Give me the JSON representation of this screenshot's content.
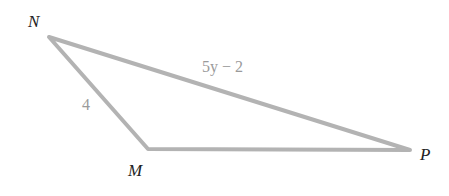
{
  "diagram": {
    "type": "triangle",
    "vertices": [
      {
        "name": "N",
        "x": 49,
        "y": 37
      },
      {
        "name": "M",
        "x": 148,
        "y": 149
      },
      {
        "name": "P",
        "x": 410,
        "y": 150
      }
    ],
    "vertex_labels": {
      "N": "N",
      "M": "M",
      "P": "P"
    },
    "side_labels": {
      "NM": "4",
      "NP": "5y − 2"
    },
    "colors": {
      "edge": "#b3b3b3",
      "side_label": "#9a9a9a",
      "vertex_label": "#222222"
    }
  }
}
